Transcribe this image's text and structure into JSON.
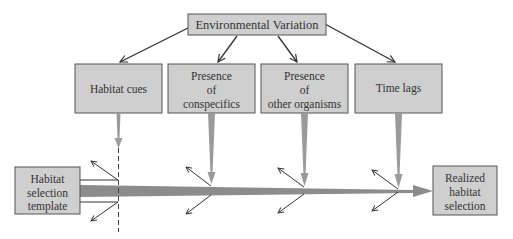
{
  "diagram": {
    "top_node": {
      "label": "Environmental Variation"
    },
    "factors": [
      {
        "id": "habitat-cues",
        "lines": [
          "Habitat cues"
        ]
      },
      {
        "id": "conspecifics",
        "lines": [
          "Presence",
          "of",
          "conspecifics"
        ]
      },
      {
        "id": "other-organisms",
        "lines": [
          "Presence",
          "of",
          "other organisms"
        ]
      },
      {
        "id": "time-lags",
        "lines": [
          "Time lags"
        ]
      }
    ],
    "start_node": {
      "lines": [
        "Habitat",
        "selection",
        "template"
      ]
    },
    "end_node": {
      "lines": [
        "Realized",
        "habitat",
        "selection"
      ]
    }
  },
  "colors": {
    "box_fill": "#cfcfcf",
    "box_stroke": "#555555",
    "main_arrow": "#8c8c8c",
    "factor_arrow": "#9a9a9a",
    "line": "#333333",
    "text": "#333333"
  }
}
